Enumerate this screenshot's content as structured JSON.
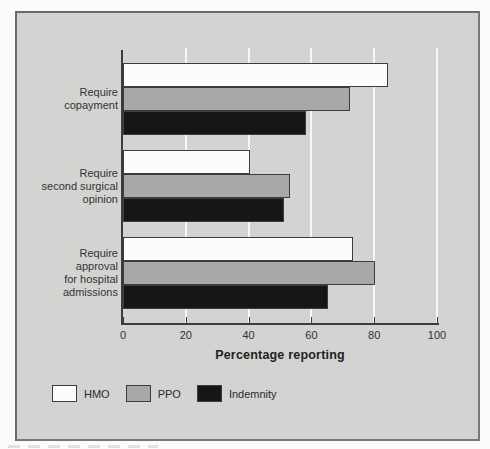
{
  "chart_data": {
    "type": "bar",
    "orientation": "horizontal",
    "title": "",
    "categories": [
      "Require copayment",
      "Require second surgical opinion",
      "Require approval for hospital admissions"
    ],
    "category_lines": [
      [
        "Require",
        "copayment"
      ],
      [
        "Require",
        "second surgical",
        "opinion"
      ],
      [
        "Require",
        "approval",
        "for hospital",
        "admissions"
      ]
    ],
    "series": [
      {
        "name": "HMO",
        "color": "#fcfcfc",
        "values": [
          84,
          40,
          73
        ]
      },
      {
        "name": "PPO",
        "color": "#a8a8a8",
        "values": [
          72,
          53,
          80
        ]
      },
      {
        "name": "Indemnity",
        "color": "#161616",
        "values": [
          58,
          51,
          65
        ]
      }
    ],
    "xlabel": "Percentage reporting",
    "xlim": [
      0,
      100
    ],
    "xticks": [
      0,
      20,
      40,
      60,
      80,
      100
    ],
    "grid": true,
    "legend_entries": [
      "HMO",
      "PPO",
      "Indemnity"
    ],
    "legend_position": "bottom-left",
    "colors": {
      "figure_background": "#d3d3d2",
      "page_background": "#fbfbfa",
      "frame_border": "#787878",
      "axis": "#3c3c3c",
      "gridline": "#ffffff",
      "text": "#333333",
      "bar_border": "#3c3c3c"
    }
  }
}
